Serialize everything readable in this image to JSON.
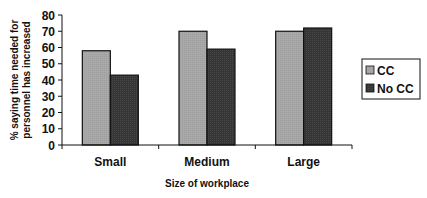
{
  "chart_data": {
    "type": "bar",
    "title": "",
    "xlabel": "Size of workplace",
    "ylabel": "% saying time needed for personnel has increased",
    "ylabel_lines": [
      "% saying time needed for",
      "personnel has increased"
    ],
    "categories": [
      "Small",
      "Medium",
      "Large"
    ],
    "series": [
      {
        "name": "CC",
        "values": [
          58,
          70,
          70
        ],
        "color": "#a9a9a9"
      },
      {
        "name": "No CC",
        "values": [
          43,
          59,
          72
        ],
        "color": "#353535"
      }
    ],
    "ylim": [
      0,
      80
    ],
    "yticks": [
      0,
      10,
      20,
      30,
      40,
      50,
      60,
      70,
      80
    ],
    "grid": false,
    "legend_position": "right"
  }
}
